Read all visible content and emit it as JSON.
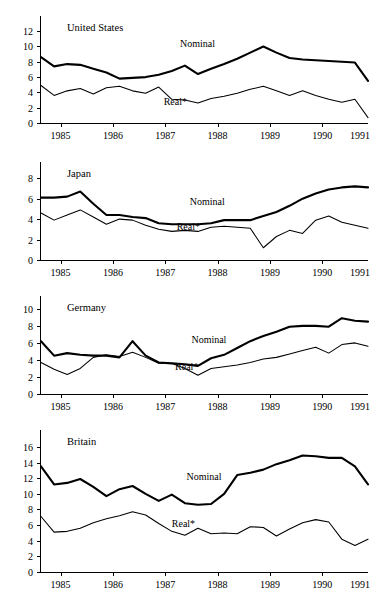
{
  "chart_data": [
    {
      "type": "line",
      "title": "United States",
      "xlabel": "",
      "ylabel": "",
      "xlim": [
        1984.625,
        1990.875
      ],
      "ylim": [
        0,
        13.2
      ],
      "yticks": [
        0,
        2,
        4,
        6,
        8,
        10,
        12
      ],
      "xticks": [
        1985,
        1986,
        1987,
        1988,
        1989,
        1990,
        1991
      ],
      "xtick_labels": [
        "1985",
        "1986",
        "1987",
        "1988",
        "1989",
        "1990",
        "1991"
      ],
      "grid": false,
      "legend": "inline-annotations",
      "annotations": [
        "Nominal",
        "Real*"
      ],
      "x": [
        1984.625,
        1984.875,
        1985.125,
        1985.375,
        1985.625,
        1985.875,
        1986.125,
        1986.375,
        1986.625,
        1986.875,
        1987.125,
        1987.375,
        1987.625,
        1987.875,
        1988.125,
        1988.375,
        1988.625,
        1988.875,
        1989.125,
        1989.375,
        1989.625,
        1989.875,
        1990.125,
        1990.375,
        1990.625,
        1990.875
      ],
      "series": [
        {
          "name": "Nominal",
          "values": [
            8.6,
            7.4,
            7.7,
            7.6,
            7.1,
            6.6,
            5.8,
            5.9,
            6.0,
            6.3,
            6.8,
            7.5,
            6.4,
            7.1,
            7.7,
            8.4,
            9.2,
            10.0,
            9.2,
            8.5,
            8.3,
            8.2,
            8.1,
            8.0,
            7.9,
            5.5
          ]
        },
        {
          "name": "Real*",
          "values": [
            4.9,
            3.6,
            4.2,
            4.5,
            3.8,
            4.6,
            4.8,
            4.2,
            3.9,
            4.7,
            3.1,
            3.0,
            2.6,
            3.2,
            3.5,
            3.9,
            4.4,
            4.8,
            4.2,
            3.6,
            4.2,
            3.6,
            3.1,
            2.7,
            3.1,
            0.7
          ]
        }
      ]
    },
    {
      "type": "line",
      "title": "Japan",
      "xlabel": "",
      "ylabel": "",
      "xlim": [
        1984.625,
        1990.875
      ],
      "ylim": [
        0,
        9.0
      ],
      "yticks": [
        0,
        2,
        4,
        6,
        8
      ],
      "xticks": [
        1985,
        1986,
        1987,
        1988,
        1989,
        1990,
        1991
      ],
      "xtick_labels": [
        "1985",
        "1986",
        "1987",
        "1988",
        "1989",
        "1990",
        "1991"
      ],
      "grid": false,
      "legend": "inline-annotations",
      "annotations": [
        "Nominal",
        "Real*"
      ],
      "x": [
        1984.625,
        1984.875,
        1985.125,
        1985.375,
        1985.625,
        1985.875,
        1986.125,
        1986.375,
        1986.625,
        1986.875,
        1987.125,
        1987.375,
        1987.625,
        1987.875,
        1988.125,
        1988.375,
        1988.625,
        1988.875,
        1989.125,
        1989.375,
        1989.625,
        1989.875,
        1990.125,
        1990.375,
        1990.625,
        1990.875
      ],
      "series": [
        {
          "name": "Nominal",
          "values": [
            6.1,
            6.1,
            6.2,
            6.7,
            5.5,
            4.4,
            4.4,
            4.2,
            4.1,
            3.6,
            3.5,
            3.5,
            3.5,
            3.6,
            3.9,
            3.9,
            3.9,
            4.3,
            4.7,
            5.3,
            6.0,
            6.5,
            6.9,
            7.1,
            7.2,
            7.1
          ]
        },
        {
          "name": "Real*",
          "values": [
            4.6,
            3.9,
            4.4,
            4.9,
            4.2,
            3.5,
            4.0,
            3.9,
            3.4,
            3.0,
            2.8,
            2.9,
            2.8,
            3.2,
            3.3,
            3.2,
            3.1,
            1.2,
            2.3,
            2.9,
            2.6,
            3.9,
            4.3,
            3.7,
            3.4,
            3.1
          ]
        }
      ]
    },
    {
      "type": "line",
      "title": "Germany",
      "xlabel": "",
      "ylabel": "",
      "xlim": [
        1984.625,
        1990.875
      ],
      "ylim": [
        0,
        10.8
      ],
      "yticks": [
        0,
        2,
        4,
        6,
        8,
        10
      ],
      "xticks": [
        1985,
        1986,
        1987,
        1988,
        1989,
        1990,
        1991
      ],
      "xtick_labels": [
        "1985",
        "1986",
        "1987",
        "1988",
        "1989",
        "1990",
        "1991"
      ],
      "grid": false,
      "legend": "inline-annotations",
      "annotations": [
        "Nominal",
        "Real*"
      ],
      "x": [
        1984.625,
        1984.875,
        1985.125,
        1985.375,
        1985.625,
        1985.875,
        1986.125,
        1986.375,
        1986.625,
        1986.875,
        1987.125,
        1987.375,
        1987.625,
        1987.875,
        1988.125,
        1988.375,
        1988.625,
        1988.875,
        1989.125,
        1989.375,
        1989.625,
        1989.875,
        1990.125,
        1990.375,
        1990.625,
        1990.875
      ],
      "series": [
        {
          "name": "Nominal",
          "values": [
            6.2,
            4.5,
            4.8,
            4.6,
            4.5,
            4.5,
            4.3,
            6.2,
            4.5,
            3.7,
            3.6,
            3.5,
            3.3,
            4.2,
            4.6,
            5.4,
            6.2,
            6.8,
            7.3,
            7.9,
            8.0,
            8.0,
            7.9,
            8.9,
            8.6,
            8.5
          ]
        },
        {
          "name": "Real*",
          "values": [
            3.7,
            2.9,
            2.3,
            3.0,
            4.3,
            4.6,
            4.4,
            4.9,
            4.3,
            3.6,
            3.6,
            3.0,
            2.2,
            3.0,
            3.2,
            3.4,
            3.7,
            4.1,
            4.3,
            4.7,
            5.1,
            5.5,
            4.8,
            5.8,
            6.0,
            5.6
          ]
        }
      ]
    },
    {
      "type": "line",
      "title": "Britain",
      "xlabel": "",
      "ylabel": "",
      "xlim": [
        1984.625,
        1990.875
      ],
      "ylim": [
        0,
        17.4
      ],
      "yticks": [
        0,
        2,
        4,
        6,
        8,
        10,
        12,
        14,
        16
      ],
      "xticks": [
        1985,
        1986,
        1987,
        1988,
        1989,
        1990,
        1991
      ],
      "xtick_labels": [
        "1985",
        "1986",
        "1987",
        "1988",
        "1989",
        "1990",
        "1991"
      ],
      "grid": false,
      "legend": "inline-annotations",
      "annotations": [
        "Nominal",
        "Real*"
      ],
      "x": [
        1984.625,
        1984.875,
        1985.125,
        1985.375,
        1985.625,
        1985.875,
        1986.125,
        1986.375,
        1986.625,
        1986.875,
        1987.125,
        1987.375,
        1987.625,
        1987.875,
        1988.125,
        1988.375,
        1988.625,
        1988.875,
        1989.125,
        1989.375,
        1989.625,
        1989.875,
        1990.125,
        1990.375,
        1990.625,
        1990.875
      ],
      "series": [
        {
          "name": "Nominal",
          "values": [
            13.5,
            11.2,
            11.4,
            11.9,
            10.9,
            9.7,
            10.6,
            11.0,
            10.0,
            9.1,
            9.9,
            8.8,
            8.6,
            8.7,
            10.0,
            12.4,
            12.7,
            13.1,
            13.8,
            14.3,
            14.9,
            14.8,
            14.6,
            14.6,
            13.5,
            11.2
          ]
        },
        {
          "name": "Real*",
          "values": [
            7.1,
            5.1,
            5.2,
            5.6,
            6.3,
            6.8,
            7.2,
            7.7,
            7.3,
            6.2,
            5.2,
            4.7,
            5.6,
            4.9,
            5.0,
            4.9,
            5.8,
            5.7,
            4.6,
            5.5,
            6.3,
            6.7,
            6.4,
            4.2,
            3.4,
            4.2
          ]
        }
      ]
    }
  ]
}
